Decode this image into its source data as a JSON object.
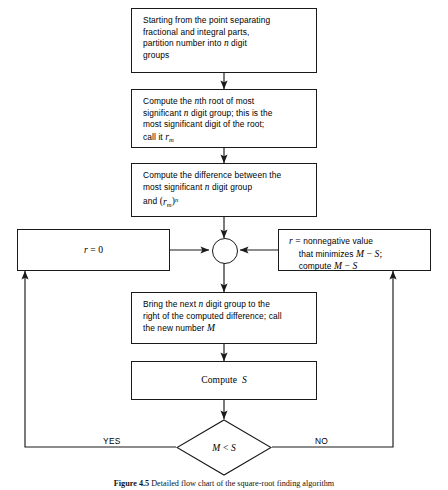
{
  "figure": {
    "caption_number": "Figure 4.5",
    "caption_text": "Detailed flow chart of the square-root finding algorithm"
  },
  "nodes": {
    "start": {
      "id": "partition-number",
      "shape": "process",
      "text": "Starting from the point separating fractional and integral parts, partition number into n digit groups"
    },
    "root_digit": {
      "id": "compute-nth-root",
      "shape": "process",
      "text": "Compute the nth root of most significant n digit group; this is the most significant digit of the root; call it rm"
    },
    "difference": {
      "id": "compute-difference",
      "shape": "process",
      "text": "Compute the difference between the most significant n digit group and (rm)n"
    },
    "reset": {
      "id": "set-r-zero",
      "shape": "process",
      "text": "r = 0"
    },
    "minimize": {
      "id": "compute-nonnegative-r",
      "shape": "process",
      "text": "r = nonnegative value that minimizes M - S; compute M - S"
    },
    "junction": {
      "id": "merge-point",
      "shape": "connector",
      "text": ""
    },
    "bring_down": {
      "id": "bring-next-digit-group",
      "shape": "process",
      "text": "Bring the next n digit group to the right of the computed difference; call the new number M"
    },
    "compute_s": {
      "id": "compute-s",
      "shape": "process",
      "text": "Compute S"
    },
    "decision": {
      "id": "m-less-than-s",
      "shape": "decision",
      "text": "M < S"
    }
  },
  "branches": {
    "yes_label": "YES",
    "no_label": "NO"
  },
  "style": {
    "line_color": "#1a1a1a",
    "background": "#ffffff"
  }
}
